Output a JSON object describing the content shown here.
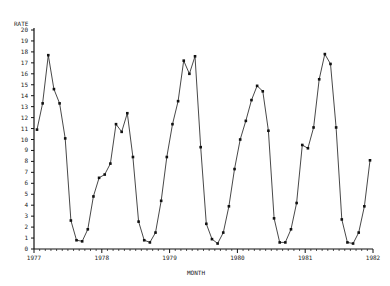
{
  "chart_data": {
    "type": "line",
    "title": "",
    "xlabel": "MONTH",
    "ylabel": "RATE",
    "ylim": [
      0,
      20
    ],
    "yticks": [
      0,
      1,
      2,
      3,
      4,
      5,
      6,
      7,
      8,
      9,
      10,
      11,
      12,
      13,
      14,
      15,
      16,
      17,
      18,
      19,
      20
    ],
    "xticks": [
      "1977",
      "1978",
      "1979",
      "1980",
      "1981",
      "1982"
    ],
    "grid": false,
    "legend": null,
    "x_start": "1977-01",
    "x_frequency": "monthly",
    "series": [
      {
        "name": "RATE",
        "marker": "dot",
        "values": [
          10.9,
          13.3,
          17.7,
          14.6,
          13.3,
          10.1,
          2.6,
          0.8,
          0.7,
          1.8,
          4.8,
          6.5,
          6.8,
          7.8,
          11.4,
          10.7,
          12.4,
          8.4,
          2.5,
          0.8,
          0.6,
          1.5,
          4.4,
          8.4,
          11.4,
          13.5,
          17.2,
          16.0,
          17.6,
          9.3,
          2.3,
          0.9,
          0.5,
          1.5,
          3.9,
          7.3,
          10.0,
          11.7,
          13.6,
          14.9,
          14.4,
          10.8,
          2.8,
          0.6,
          0.6,
          1.8,
          4.2,
          9.5,
          9.2,
          11.1,
          15.5,
          17.8,
          16.9,
          11.1,
          2.7,
          0.6,
          0.5,
          1.5,
          3.9,
          8.1
        ]
      }
    ]
  },
  "style": {
    "line_color": "#333333",
    "axis_color": "#111111"
  }
}
